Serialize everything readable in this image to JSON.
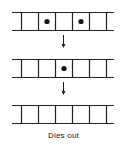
{
  "diagram": {
    "strips": [
      {
        "label": "generation-1",
        "cells": 6,
        "alive": [
          1,
          3
        ]
      },
      {
        "label": "generation-2",
        "cells": 6,
        "alive": [
          2
        ]
      },
      {
        "label": "generation-3",
        "cells": 6,
        "alive": []
      }
    ],
    "caption": "Dies out",
    "colors": {
      "stroke": "#222222",
      "dot": "#111111"
    }
  }
}
